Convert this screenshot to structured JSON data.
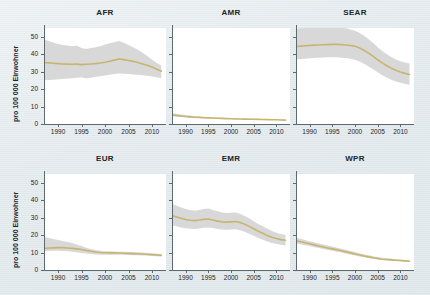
{
  "figure": {
    "background_color": "#e5ecef",
    "ylabel": "pro 100 000 Einwohner",
    "band_color": "#c9c9c9",
    "line_color": "#c6b571",
    "axis_color": "#5e6a6e"
  },
  "axes": {
    "y_ticks": [
      "0",
      "10",
      "20",
      "30",
      "40",
      "50"
    ],
    "y_values": [
      0,
      10,
      20,
      30,
      40,
      50
    ],
    "x_ticks": [
      "1990",
      "1995",
      "2000",
      "2005",
      "2010"
    ],
    "x_values": [
      1990,
      1995,
      2000,
      2005,
      2010
    ],
    "xlim": [
      1987,
      2013
    ],
    "ylim": [
      0,
      55
    ]
  },
  "chart_data": {
    "type": "line",
    "title": "",
    "xlabel": "",
    "ylabel": "pro 100 000 Einwohner",
    "ylim": [
      0,
      55
    ],
    "xlim": [
      1987,
      2013
    ],
    "grid": false,
    "legend": "none",
    "panel_layout": [
      [
        "AFR",
        "AMR",
        "SEAR"
      ],
      [
        "EUR",
        "EMR",
        "WPR"
      ]
    ],
    "x": [
      1987,
      1988,
      1989,
      1990,
      1991,
      1992,
      1993,
      1994,
      1995,
      1996,
      1997,
      1998,
      1999,
      2000,
      2001,
      2002,
      2003,
      2004,
      2005,
      2006,
      2007,
      2008,
      2009,
      2010,
      2011,
      2012
    ],
    "panels": [
      {
        "name": "AFR",
        "title": "AFR",
        "median": [
          35.2,
          35.0,
          34.8,
          34.6,
          34.4,
          34.3,
          34.2,
          34.3,
          34.0,
          34.2,
          34.4,
          34.6,
          34.9,
          35.4,
          36.0,
          36.6,
          37.2,
          36.9,
          36.4,
          35.9,
          35.2,
          34.4,
          33.6,
          32.6,
          31.4,
          30.2
        ],
        "lower": [
          25.0,
          25.2,
          25.4,
          25.6,
          25.8,
          26.0,
          26.2,
          26.5,
          26.8,
          26.0,
          26.5,
          27.0,
          27.4,
          27.8,
          28.2,
          28.6,
          29.0,
          28.8,
          28.6,
          28.4,
          28.2,
          28.0,
          27.6,
          27.2,
          26.8,
          26.4
        ],
        "upper": [
          48.5,
          47.5,
          46.5,
          45.8,
          45.2,
          45.0,
          44.5,
          44.8,
          43.5,
          43.0,
          43.5,
          44.0,
          44.5,
          45.5,
          46.2,
          46.8,
          47.5,
          46.5,
          45.2,
          44.0,
          42.5,
          40.8,
          39.0,
          37.0,
          35.0,
          33.5
        ]
      },
      {
        "name": "AMR",
        "title": "AMR",
        "median": [
          5.2,
          4.9,
          4.6,
          4.3,
          4.1,
          3.9,
          3.8,
          3.6,
          3.5,
          3.4,
          3.3,
          3.2,
          3.1,
          3.0,
          2.9,
          2.85,
          2.8,
          2.75,
          2.7,
          2.65,
          2.6,
          2.5,
          2.45,
          2.4,
          2.3,
          2.2
        ],
        "lower": [
          4.4,
          4.2,
          4.0,
          3.8,
          3.6,
          3.5,
          3.4,
          3.3,
          3.2,
          3.1,
          3.05,
          3.0,
          2.9,
          2.85,
          2.75,
          2.7,
          2.65,
          2.6,
          2.55,
          2.5,
          2.45,
          2.4,
          2.3,
          2.25,
          2.2,
          2.1
        ],
        "upper": [
          6.3,
          5.9,
          5.5,
          5.1,
          4.8,
          4.5,
          4.3,
          4.1,
          3.9,
          3.8,
          3.7,
          3.6,
          3.5,
          3.4,
          3.3,
          3.2,
          3.15,
          3.1,
          3.0,
          2.95,
          2.9,
          2.8,
          2.7,
          2.6,
          2.5,
          2.4
        ]
      },
      {
        "name": "SEAR",
        "title": "SEAR",
        "median": [
          44.5,
          44.6,
          44.8,
          45.0,
          45.2,
          45.3,
          45.4,
          45.5,
          45.6,
          45.6,
          45.5,
          45.3,
          45.0,
          44.5,
          43.5,
          42.2,
          40.6,
          38.8,
          36.8,
          35.0,
          33.4,
          32.0,
          30.8,
          29.8,
          29.0,
          28.3
        ],
        "lower": [
          37.0,
          37.2,
          37.4,
          37.6,
          37.8,
          38.0,
          38.1,
          38.2,
          38.3,
          38.2,
          38.0,
          37.8,
          37.4,
          36.8,
          35.8,
          34.5,
          33.0,
          31.4,
          29.6,
          28.0,
          26.6,
          25.4,
          24.4,
          23.6,
          23.0,
          22.4
        ],
        "upper": [
          54.5,
          54.8,
          55.0,
          55.2,
          55.4,
          55.5,
          55.6,
          55.6,
          55.5,
          55.4,
          55.2,
          54.8,
          54.2,
          53.4,
          52.2,
          50.6,
          48.6,
          46.4,
          44.0,
          41.8,
          40.0,
          38.4,
          37.0,
          36.0,
          35.2,
          34.6
        ]
      },
      {
        "name": "EUR",
        "title": "EUR",
        "median": [
          12.4,
          12.6,
          12.7,
          12.8,
          12.8,
          12.6,
          12.4,
          12.1,
          11.7,
          11.2,
          10.7,
          10.3,
          10.0,
          9.9,
          9.8,
          9.8,
          9.7,
          9.6,
          9.5,
          9.4,
          9.3,
          9.2,
          9.0,
          8.8,
          8.6,
          8.4
        ],
        "lower": [
          10.8,
          10.9,
          11.0,
          11.0,
          10.9,
          10.7,
          10.5,
          10.2,
          9.8,
          9.4,
          9.1,
          8.9,
          8.8,
          8.8,
          8.8,
          8.8,
          8.7,
          8.7,
          8.6,
          8.5,
          8.4,
          8.3,
          8.2,
          8.0,
          7.9,
          7.7
        ],
        "upper": [
          19.0,
          18.4,
          17.8,
          17.2,
          16.6,
          16.0,
          15.4,
          14.6,
          13.8,
          12.8,
          12.0,
          11.4,
          11.0,
          10.8,
          10.7,
          10.6,
          10.5,
          10.4,
          10.3,
          10.2,
          10.1,
          10.0,
          9.8,
          9.6,
          9.4,
          9.2
        ]
      },
      {
        "name": "EMR",
        "title": "EMR",
        "median": [
          31.2,
          30.4,
          29.6,
          28.9,
          28.5,
          28.3,
          28.6,
          29.0,
          29.2,
          28.6,
          28.0,
          27.6,
          27.4,
          27.6,
          27.8,
          27.2,
          26.2,
          25.0,
          23.6,
          22.2,
          21.0,
          19.8,
          18.8,
          18.0,
          17.4,
          17.0
        ],
        "lower": [
          25.5,
          25.0,
          24.4,
          23.9,
          23.6,
          23.5,
          23.8,
          24.2,
          24.4,
          24.0,
          23.5,
          23.2,
          23.0,
          23.2,
          23.4,
          22.8,
          21.9,
          20.8,
          19.6,
          18.4,
          17.3,
          16.3,
          15.5,
          14.9,
          14.4,
          14.0
        ],
        "upper": [
          38.0,
          36.8,
          35.8,
          35.0,
          34.4,
          34.0,
          34.4,
          35.0,
          35.2,
          34.4,
          33.6,
          33.0,
          32.6,
          32.8,
          33.0,
          32.2,
          31.0,
          29.6,
          28.0,
          26.4,
          25.0,
          23.6,
          22.4,
          21.4,
          20.6,
          20.0
        ]
      },
      {
        "name": "WPR",
        "title": "WPR",
        "median": [
          16.8,
          16.2,
          15.6,
          15.0,
          14.4,
          13.8,
          13.2,
          12.6,
          12.1,
          11.6,
          11.0,
          10.4,
          9.8,
          9.2,
          8.6,
          8.0,
          7.5,
          7.0,
          6.6,
          6.2,
          6.0,
          5.8,
          5.6,
          5.4,
          5.2,
          5.0
        ],
        "lower": [
          15.2,
          14.7,
          14.2,
          13.7,
          13.1,
          12.6,
          12.0,
          11.5,
          11.0,
          10.5,
          10.0,
          9.4,
          8.9,
          8.3,
          7.8,
          7.3,
          6.8,
          6.4,
          6.0,
          5.7,
          5.5,
          5.3,
          5.1,
          5.0,
          4.8,
          4.7
        ],
        "upper": [
          18.6,
          17.9,
          17.2,
          16.5,
          15.9,
          15.2,
          14.6,
          14.0,
          13.4,
          12.8,
          12.2,
          11.6,
          10.9,
          10.3,
          9.6,
          9.0,
          8.4,
          7.9,
          7.4,
          7.0,
          6.7,
          6.4,
          6.2,
          6.0,
          5.8,
          5.6
        ]
      }
    ]
  }
}
